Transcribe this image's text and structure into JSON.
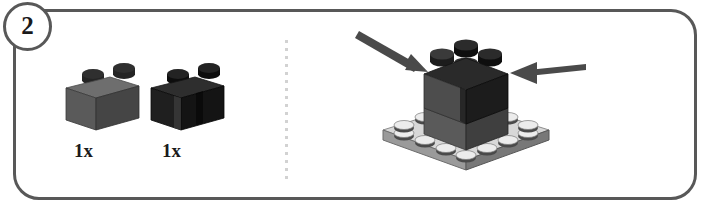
{
  "step": {
    "number": "2",
    "badge_name": "step-number-badge"
  },
  "frame": {
    "border_color": "#585858"
  },
  "divider": {
    "style": "dotted-vertical",
    "color": "#d2d2d2",
    "dot_count": 18
  },
  "parts": [
    {
      "id": "part-brick-1x2-dark-gray",
      "quantity_label": "1x",
      "description": "brick 1x2 dark gray",
      "top_color": "#6e6e6e",
      "front_color": "#5a5a5a",
      "side_color": "#3f3f3f",
      "stud_color": "#242424"
    },
    {
      "id": "part-brick-1x2-black-groove",
      "quantity_label": "1x",
      "description": "brick 1x2 black with groove",
      "top_color": "#2e2e2e",
      "front_color": "#1f1f1f",
      "side_color": "#141414",
      "stud_color": "#111111"
    }
  ],
  "assembly": {
    "name": "step-assembly-diagram",
    "baseplate": {
      "description": "plate 4x4 light gray",
      "top_color": "#d8d8d8",
      "front_color": "#9a9a9a",
      "side_color": "#787878",
      "stud_color": "#e8e8e8",
      "stud_shade": "#4a4a4a"
    },
    "bricks": [
      {
        "description": "brick dark gray left",
        "color": "#4d4d4d"
      },
      {
        "description": "brick black right",
        "color": "#1c1c1c"
      }
    ],
    "arrows": [
      {
        "id": "arrow-left",
        "direction": "down-right",
        "color": "#4a4a4a"
      },
      {
        "id": "arrow-right",
        "direction": "left",
        "color": "#4a4a4a"
      }
    ]
  },
  "colors": {
    "ink": "#1a1a1a",
    "frame": "#585858",
    "dot": "#d2d2d2"
  }
}
